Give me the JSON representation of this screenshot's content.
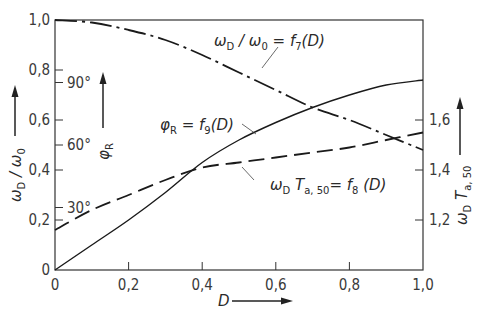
{
  "chart_data": {
    "type": "line",
    "title": "",
    "xlabel": "D",
    "ylabel_left": "ωD / ω0",
    "ylabel_left_angle": "φR",
    "ylabel_right": "ωD Ta,50",
    "xlim": [
      0,
      1.0
    ],
    "ylim_left": [
      0,
      1.0
    ],
    "ylim_right": [
      1.0,
      2.0
    ],
    "x_ticks": [
      "0",
      "0,2",
      "0,4",
      "0,6",
      "0,8",
      "1,0"
    ],
    "y_ticks_left": [
      "0",
      "0,2",
      "0,4",
      "0,6",
      "0,8",
      "1,0"
    ],
    "y_ticks_angle": [
      "30°",
      "60°",
      "90°"
    ],
    "y_ticks_right": [
      "1,2",
      "1,4",
      "1,6"
    ],
    "grid": false,
    "x": [
      0,
      0.1,
      0.2,
      0.3,
      0.4,
      0.5,
      0.6,
      0.7,
      0.8,
      0.9,
      1.0
    ],
    "series": [
      {
        "name": "ωD / ω0 = f7(D)",
        "style": "dash-dot",
        "axis": "left",
        "values": [
          1.0,
          0.99,
          0.96,
          0.92,
          0.86,
          0.79,
          0.72,
          0.65,
          0.6,
          0.54,
          0.48
        ]
      },
      {
        "name": "φR = f9(D)",
        "style": "solid",
        "axis": "angle (0–1 ↔ 0°–120°)",
        "values": [
          0.0,
          0.1,
          0.2,
          0.31,
          0.43,
          0.52,
          0.59,
          0.65,
          0.7,
          0.74,
          0.76
        ]
      },
      {
        "name": "ωD Ta,50 = f8(D)",
        "style": "dashed",
        "axis": "right",
        "values": [
          1.16,
          1.24,
          1.3,
          1.36,
          1.41,
          1.43,
          1.45,
          1.47,
          1.49,
          1.52,
          1.55
        ]
      }
    ],
    "annotations": [
      {
        "text": "ωD / ω0 = f7(D)"
      },
      {
        "text": "φR = f9(D)"
      },
      {
        "text": "ωD Ta,50 = f8(D)"
      }
    ]
  },
  "labels": {
    "x_axis": "D",
    "left_axis_main": "ω",
    "left_axis_sub1": "D",
    "left_axis_sub2": "0",
    "angle_axis": "φ",
    "angle_axis_sub": "R",
    "right_axis_main": "ω",
    "right_axis_sub1": "D",
    "right_axis_T": "T",
    "right_axis_sub2": "a, 50",
    "f7_text": "ω",
    "f7_sub": "D",
    "f7_mid": " / ω",
    "f7_sub2": "0",
    "f7_rest": " = f",
    "f7_idx": "7",
    "f7_tail": "(D)",
    "f9_main": "φ",
    "f9_sub": "R",
    "f9_rest": " = f",
    "f9_idx": "9",
    "f9_tail": "(D)",
    "f8_main": "ω",
    "f8_sub": "D",
    "f8_T": " T",
    "f8_sub2": "a, 50",
    "f8_rest": "= f",
    "f8_idx": "8",
    "f8_tail": " (D)"
  }
}
